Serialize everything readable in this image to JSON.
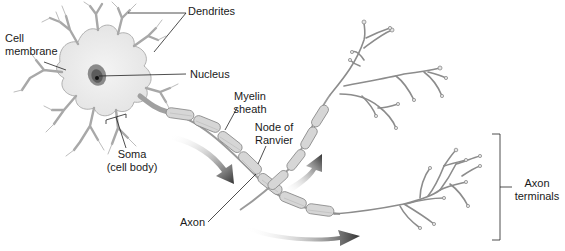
{
  "diagram": {
    "colors": {
      "cell_fill": "#ececec",
      "cell_stroke": "#9a9a9a",
      "nucleus_outer": "#8a8a8a",
      "nucleus_inner": "#5a5a5a",
      "nucleolus": "#111111",
      "myelin_fill": "#d4d4d4",
      "myelin_stroke": "#888888",
      "terminal_stroke": "#8c8c8c",
      "arrow": "#3a3a3a",
      "leader_line": "#222222",
      "text": "#1a1a1a"
    },
    "labels": {
      "dendrites": "Dendrites",
      "cell_membrane_1": "Cell",
      "cell_membrane_2": "membrane",
      "nucleus": "Nucleus",
      "myelin_1": "Myelin",
      "myelin_2": "sheath",
      "node_1": "Node of",
      "node_2": "Ranvier",
      "soma_1": "Soma",
      "soma_2": "(cell body)",
      "axon": "Axon",
      "terminals_1": "Axon",
      "terminals_2": "terminals"
    },
    "arrows": [
      {
        "name": "signal-direction-arrow-upper",
        "direction": "down-right"
      },
      {
        "name": "signal-direction-arrow-middle",
        "direction": "up-right"
      },
      {
        "name": "signal-direction-arrow-lower",
        "direction": "right"
      }
    ]
  }
}
